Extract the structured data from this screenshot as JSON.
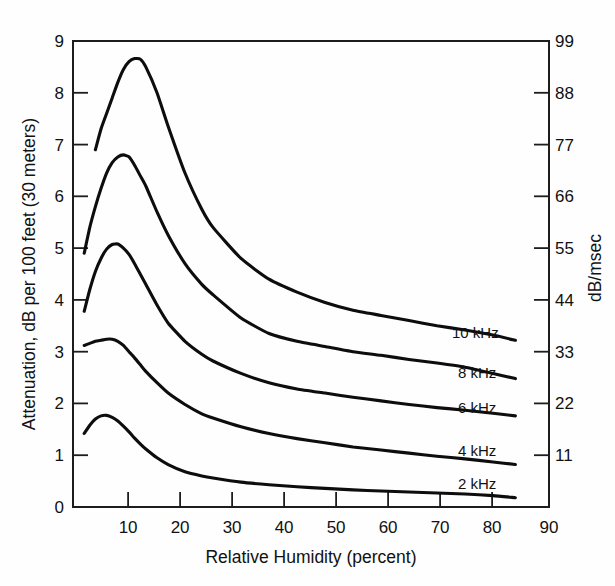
{
  "chart_data": {
    "type": "line",
    "title": "",
    "subtitle": "",
    "xlabel": "Relative Humidity (percent)",
    "ylabel": "Attenuation, dB per 100 feet (30 meters)",
    "y2label": "dB/msec",
    "xlim": [
      5,
      90
    ],
    "ylim": [
      0,
      9
    ],
    "y2lim": [
      0,
      99
    ],
    "grid": false,
    "legend_position": "inline-right-of-curve-ends",
    "xticks": [
      10,
      20,
      30,
      40,
      50,
      60,
      70,
      80,
      90
    ],
    "xticklabels": [
      "10",
      "20",
      "30",
      "40",
      "50",
      "60",
      "70",
      "80",
      "90"
    ],
    "yticks": [
      0,
      1,
      2,
      3,
      4,
      5,
      6,
      7,
      8,
      9
    ],
    "yticklabels": [
      "0",
      "1",
      "2",
      "3",
      "4",
      "5",
      "6",
      "7",
      "8",
      "9"
    ],
    "y2ticks": [
      11,
      22,
      33,
      44,
      55,
      66,
      77,
      88,
      99
    ],
    "y2ticklabels": [
      "11",
      "22",
      "33",
      "44",
      "55",
      "66",
      "77",
      "88",
      "99"
    ],
    "line_color": "#0d0d0d",
    "axis_color": "#1d1d1d",
    "background_color": "#fefefe",
    "x": [
      7,
      8,
      9,
      10,
      11,
      12,
      13,
      14,
      15,
      16,
      17,
      18,
      20,
      22,
      25,
      28,
      30,
      35,
      40,
      45,
      50,
      55,
      60,
      65,
      70,
      75,
      80,
      84
    ],
    "series": [
      {
        "name": "10 kHz",
        "label": "10 kHz",
        "x": [
          9,
          10,
          11,
          12,
          13,
          14,
          15,
          16,
          17,
          18,
          20,
          22,
          25,
          28,
          30,
          35,
          40,
          45,
          50,
          55,
          60,
          65,
          70,
          75,
          80,
          84
        ],
        "values": [
          6.9,
          7.3,
          7.6,
          7.9,
          8.2,
          8.45,
          8.6,
          8.66,
          8.65,
          8.5,
          8.0,
          7.35,
          6.45,
          5.75,
          5.4,
          4.8,
          4.4,
          4.15,
          3.95,
          3.8,
          3.7,
          3.6,
          3.5,
          3.42,
          3.32,
          3.22
        ],
        "peak": {
          "x": 16.5,
          "y": 8.66
        }
      },
      {
        "name": "8 kHz",
        "label": "8 kHz",
        "x": [
          7,
          8,
          9,
          10,
          11,
          12,
          13,
          14,
          15,
          16,
          17,
          18,
          20,
          22,
          25,
          28,
          30,
          35,
          40,
          45,
          50,
          55,
          60,
          65,
          70,
          75,
          80,
          84
        ],
        "values": [
          4.9,
          5.4,
          5.8,
          6.15,
          6.45,
          6.65,
          6.76,
          6.8,
          6.76,
          6.6,
          6.4,
          6.2,
          5.7,
          5.25,
          4.7,
          4.3,
          4.1,
          3.65,
          3.35,
          3.2,
          3.1,
          3.0,
          2.93,
          2.85,
          2.78,
          2.7,
          2.58,
          2.48
        ],
        "peak": {
          "x": 14,
          "y": 6.8
        }
      },
      {
        "name": "6 kHz",
        "label": "6 kHz",
        "x": [
          7,
          8,
          9,
          10,
          11,
          12,
          13,
          14,
          15,
          16,
          17,
          18,
          20,
          22,
          25,
          28,
          30,
          35,
          40,
          45,
          50,
          55,
          60,
          65,
          70,
          75,
          80,
          84
        ],
        "values": [
          3.78,
          4.2,
          4.55,
          4.8,
          4.98,
          5.07,
          5.08,
          5.0,
          4.88,
          4.7,
          4.5,
          4.3,
          3.9,
          3.55,
          3.2,
          2.95,
          2.82,
          2.58,
          2.4,
          2.28,
          2.2,
          2.12,
          2.05,
          1.98,
          1.92,
          1.87,
          1.81,
          1.76
        ],
        "peak": {
          "x": 12.5,
          "y": 5.08
        }
      },
      {
        "name": "4 kHz",
        "label": "4 kHz",
        "x": [
          7,
          8,
          9,
          10,
          11,
          12,
          13,
          14,
          15,
          16,
          17,
          18,
          20,
          22,
          25,
          28,
          30,
          35,
          40,
          45,
          50,
          55,
          60,
          65,
          70,
          75,
          80,
          84
        ],
        "values": [
          3.12,
          3.16,
          3.2,
          3.22,
          3.24,
          3.24,
          3.2,
          3.12,
          3.0,
          2.88,
          2.75,
          2.62,
          2.4,
          2.2,
          1.98,
          1.8,
          1.72,
          1.55,
          1.42,
          1.32,
          1.24,
          1.16,
          1.1,
          1.04,
          0.98,
          0.93,
          0.87,
          0.82
        ],
        "peak": {
          "x": 11.8,
          "y": 3.25
        }
      },
      {
        "name": "2 kHz",
        "label": "2 kHz",
        "x": [
          7,
          8,
          9,
          10,
          11,
          12,
          13,
          14,
          15,
          16,
          17,
          18,
          20,
          22,
          25,
          28,
          30,
          35,
          40,
          45,
          50,
          55,
          60,
          65,
          70,
          75,
          80,
          84
        ],
        "values": [
          1.42,
          1.58,
          1.7,
          1.76,
          1.77,
          1.73,
          1.66,
          1.56,
          1.45,
          1.33,
          1.22,
          1.12,
          0.95,
          0.82,
          0.68,
          0.6,
          0.56,
          0.48,
          0.43,
          0.39,
          0.36,
          0.33,
          0.31,
          0.29,
          0.27,
          0.25,
          0.22,
          0.18
        ],
        "peak": {
          "x": 10.8,
          "y": 1.77
        }
      }
    ]
  }
}
